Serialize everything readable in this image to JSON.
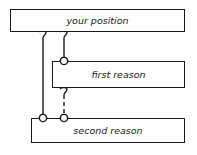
{
  "diagram": {
    "type": "argument-structure",
    "nodes": [
      {
        "id": "position",
        "label": "your position"
      },
      {
        "id": "first",
        "label": "first reason"
      },
      {
        "id": "second",
        "label": "second reason"
      }
    ],
    "edges": [
      {
        "from": "second",
        "to": "position",
        "style": "solid",
        "start_marker": "circle",
        "end_marker": "hook"
      },
      {
        "from": "first",
        "to": "position",
        "style": "solid",
        "start_marker": "circle",
        "end_marker": "hook"
      },
      {
        "from": "second",
        "to": "first",
        "style": "dashed",
        "start_marker": "circle",
        "end_marker": "hook"
      }
    ],
    "colors": {
      "stroke": "#1a1a1a",
      "background": "#ffffff"
    }
  }
}
